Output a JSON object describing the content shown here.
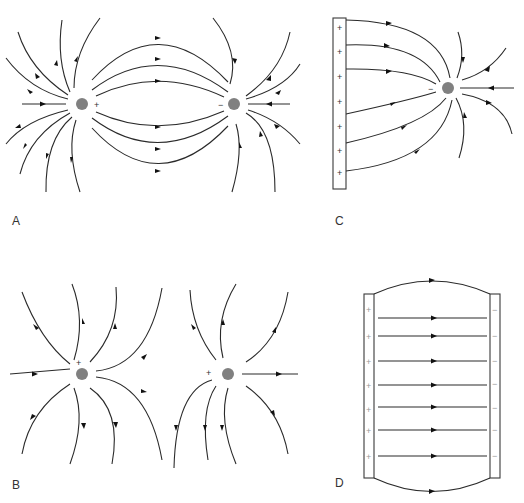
{
  "panels": [
    {
      "id": "A",
      "label": "A",
      "description": "Field lines between a positive and a negative point charge (dipole)",
      "charges": [
        {
          "sign": "+"
        },
        {
          "sign": "−"
        }
      ]
    },
    {
      "id": "B",
      "label": "B",
      "description": "Field lines of two positive point charges",
      "charges": [
        {
          "sign": "+"
        },
        {
          "sign": "+"
        }
      ]
    },
    {
      "id": "C",
      "label": "C",
      "description": "Field lines from a positively charged plate to a negative point charge",
      "plate_signs": [
        "+",
        "+",
        "+",
        "+",
        "+",
        "+",
        "+"
      ],
      "charges": [
        {
          "sign": "−"
        }
      ]
    },
    {
      "id": "D",
      "label": "D",
      "description": "Uniform field between parallel plates",
      "left_plate_signs": [
        "+",
        "+",
        "+",
        "+",
        "+",
        "+",
        "+"
      ],
      "right_plate_signs": [
        "−",
        "−",
        "−",
        "−",
        "−",
        "−",
        "−"
      ]
    }
  ],
  "colors": {
    "line": "#2a2a2a",
    "charge": "#808080",
    "plate": "#3a3a3a"
  }
}
